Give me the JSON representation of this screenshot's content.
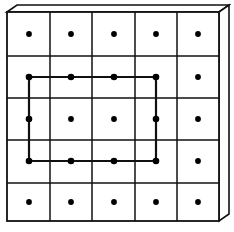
{
  "diagram": {
    "rows": 5,
    "cols": 5,
    "grid": {
      "left": 7,
      "top": 12,
      "right": 219,
      "bottom": 221,
      "x_lines": [
        7,
        50,
        92,
        135,
        177,
        219
      ],
      "y_lines": [
        12,
        56,
        98,
        140,
        183,
        221
      ]
    },
    "depth_offset": {
      "dx": 10,
      "dy": -7
    },
    "dot_centers": {
      "x": [
        29,
        71,
        114,
        156,
        198
      ],
      "y": [
        34,
        77,
        119,
        161,
        202
      ]
    },
    "highlight_rect": {
      "from_col": 0,
      "to_col": 3,
      "from_row": 1,
      "to_row": 3,
      "corner_radius": 4
    },
    "colors": {
      "line": "#111111",
      "dot": "#000000",
      "background": "#ffffff"
    }
  }
}
